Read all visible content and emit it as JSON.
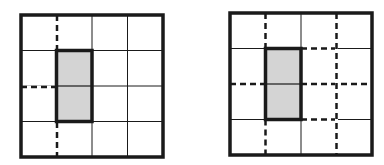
{
  "figure": {
    "colors": {
      "background": "#ffffff",
      "line": "#1a1a1a",
      "shade": "#d4d4d4"
    },
    "grids": [
      {
        "id": "left",
        "x": 21,
        "y": 15,
        "size": 142,
        "cells": 4,
        "shaded": {
          "col": 1,
          "row": 1,
          "cols": 1,
          "rows": 2
        },
        "dashed_segments": [
          {
            "x1": 57,
            "y1": 15,
            "x2": 57,
            "y2": 51
          },
          {
            "x1": 57,
            "y1": 122,
            "x2": 57,
            "y2": 158
          },
          {
            "x1": 21,
            "y1": 87,
            "x2": 57,
            "y2": 87
          }
        ]
      },
      {
        "id": "right",
        "x": 230,
        "y": 13,
        "size": 142,
        "cells": 4,
        "shaded": {
          "col": 1,
          "row": 1,
          "cols": 1,
          "rows": 2
        },
        "dashed_segments": [
          {
            "x1": 265.5,
            "y1": 13,
            "x2": 265.5,
            "y2": 48.5
          },
          {
            "x1": 265.5,
            "y1": 119.5,
            "x2": 265.5,
            "y2": 155
          },
          {
            "x1": 230,
            "y1": 84,
            "x2": 265.5,
            "y2": 84
          },
          {
            "x1": 301,
            "y1": 48.5,
            "x2": 336.5,
            "y2": 48.5
          },
          {
            "x1": 301,
            "y1": 119.5,
            "x2": 336.5,
            "y2": 119.5
          },
          {
            "x1": 301,
            "y1": 84,
            "x2": 372,
            "y2": 84
          },
          {
            "x1": 336.5,
            "y1": 13,
            "x2": 336.5,
            "y2": 155
          }
        ]
      }
    ]
  }
}
